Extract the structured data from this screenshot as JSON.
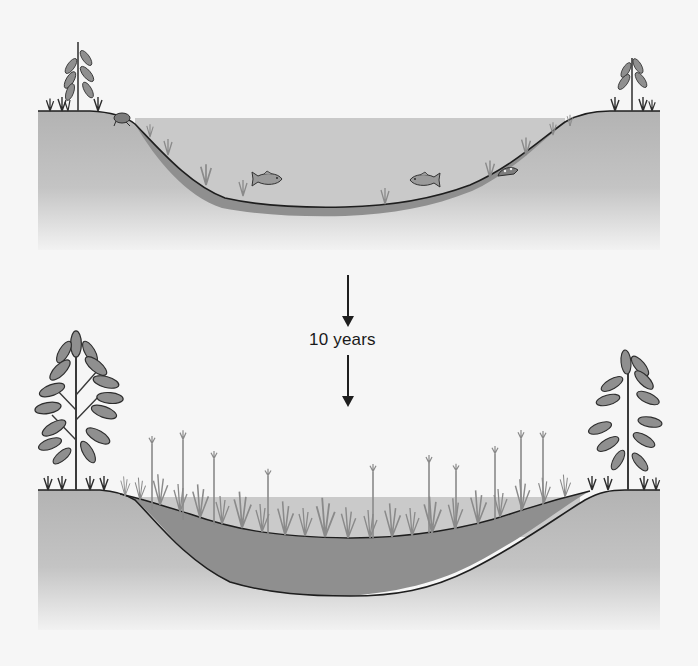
{
  "figure": {
    "panels": [
      {
        "id": "before",
        "description": "Open pond with water, fish, sparse submerged plants and thin sediment layer",
        "elements": [
          "shore-plant-left",
          "shore-plant-right",
          "frog",
          "fish-left",
          "fish-right",
          "turtle",
          "submerged-plants",
          "sediment-layer",
          "water"
        ]
      },
      {
        "id": "after",
        "description": "Pond filled with thick sediment, overgrown by grasses and cattails; larger shrubs on shore",
        "elements": [
          "shrub-left",
          "shrub-right",
          "cattails",
          "grasses",
          "sediment-layer",
          "water"
        ]
      }
    ],
    "transition": {
      "label": "10 years"
    },
    "colors": {
      "ground": "#b8b8b8",
      "ground_fade": "#f4f4f4",
      "water": "#c9c9c9",
      "sediment": "#8f8f8f",
      "outline": "#1e1e1e",
      "plant": "#8a8a8a",
      "plant_dark": "#3a3a3a",
      "background": "#f6f6f6"
    }
  }
}
